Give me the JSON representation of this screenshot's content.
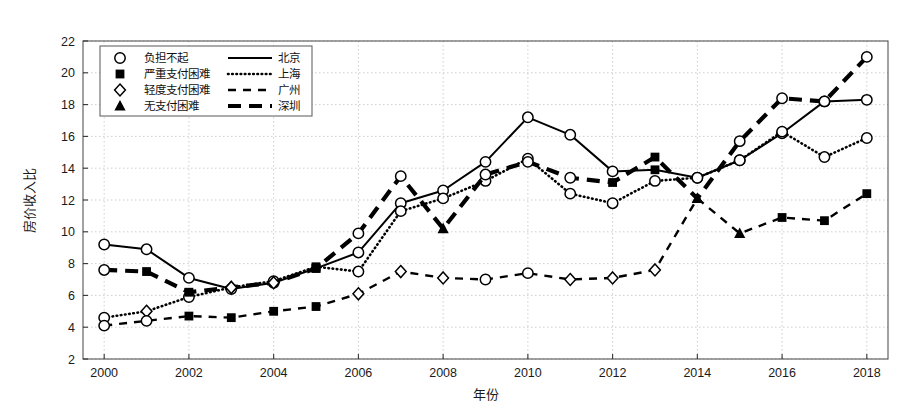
{
  "chart_data": {
    "type": "line",
    "title": "",
    "xlabel": "年份",
    "ylabel": "房价收入比",
    "xlim": [
      1999.5,
      2018.5
    ],
    "ylim": [
      2,
      22
    ],
    "ytick_step": 2,
    "xtick_step": 2,
    "grid": true,
    "grid_style": "dotted",
    "x": [
      2000,
      2001,
      2002,
      2003,
      2004,
      2005,
      2006,
      2007,
      2008,
      2009,
      2010,
      2011,
      2012,
      2013,
      2014,
      2015,
      2016,
      2017,
      2018
    ],
    "xticks": [
      "2000",
      "2002",
      "2004",
      "2006",
      "2008",
      "2010",
      "2012",
      "2014",
      "2016",
      "2018"
    ],
    "yticks": [
      "2",
      "4",
      "6",
      "8",
      "10",
      "12",
      "14",
      "16",
      "18",
      "20",
      "22"
    ],
    "legend_position": "upper-left",
    "series": [
      {
        "name": "北京",
        "line": "solid",
        "values": [
          9.2,
          8.9,
          7.1,
          6.4,
          6.8,
          7.7,
          8.7,
          11.8,
          12.6,
          14.4,
          17.2,
          16.1,
          13.8,
          13.9,
          13.4,
          14.5,
          16.2,
          18.2,
          18.3
        ],
        "status": [
          "负担不起",
          "负担不起",
          "负担不起",
          "负担不起",
          "负担不起",
          "严重支付困难",
          "负担不起",
          "负担不起",
          "负担不起",
          "负担不起",
          "负担不起",
          "负担不起",
          "负担不起",
          "严重支付困难",
          "负担不起",
          "负担不起",
          "负担不起",
          "负担不起",
          "负担不起"
        ]
      },
      {
        "name": "上海",
        "line": "dotted",
        "values": [
          4.6,
          5.0,
          5.9,
          6.5,
          6.9,
          7.8,
          7.5,
          11.3,
          12.1,
          13.2,
          14.6,
          12.4,
          11.8,
          13.2,
          13.4,
          14.5,
          16.3,
          14.7,
          15.9
        ],
        "status": [
          "负担不起",
          "轻度支付困难",
          "负担不起",
          "轻度支付困难",
          "负担不起",
          "严重支付困难",
          "负担不起",
          "负担不起",
          "负担不起",
          "负担不起",
          "负担不起",
          "负担不起",
          "负担不起",
          "负担不起",
          "负担不起",
          "负担不起",
          "负担不起",
          "负担不起",
          "负担不起"
        ]
      },
      {
        "name": "广州",
        "line": "dashed",
        "values": [
          4.1,
          4.4,
          4.7,
          4.6,
          5.0,
          5.3,
          6.1,
          7.5,
          7.1,
          7.0,
          7.4,
          7.0,
          7.1,
          7.6,
          12.1,
          9.9,
          10.9,
          10.7,
          12.4
        ],
        "status": [
          "负担不起",
          "负担不起",
          "严重支付困难",
          "严重支付困难",
          "严重支付困难",
          "严重支付困难",
          "轻度支付困难",
          "轻度支付困难",
          "轻度支付困难",
          "负担不起",
          "负担不起",
          "轻度支付困难",
          "轻度支付困难",
          "轻度支付困难",
          "无支付困难",
          "无支付困难",
          "严重支付困难",
          "严重支付困难",
          "严重支付困难"
        ]
      },
      {
        "name": "深圳",
        "line": "thick-dashed",
        "values": [
          7.6,
          7.5,
          6.2,
          6.5,
          6.8,
          7.7,
          9.9,
          13.5,
          10.2,
          13.6,
          14.4,
          13.4,
          13.1,
          14.7,
          12.1,
          15.7,
          18.4,
          18.2,
          21.0
        ],
        "status": [
          "负担不起",
          "严重支付困难",
          "严重支付困难",
          "轻度支付困难",
          "轻度支付困难",
          "严重支付困难",
          "负担不起",
          "负担不起",
          "无支付困难",
          "负担不起",
          "负担不起",
          "负担不起",
          "严重支付困难",
          "严重支付困难",
          "无支付困难",
          "负担不起",
          "负担不起",
          "负担不起",
          "负担不起"
        ]
      }
    ],
    "marker_legend": [
      {
        "marker": "circle-open",
        "label": "负担不起"
      },
      {
        "marker": "square-filled",
        "label": "严重支付困难"
      },
      {
        "marker": "diamond-open",
        "label": "轻度支付困难"
      },
      {
        "marker": "triangle-filled",
        "label": "无支付困难"
      }
    ]
  },
  "colors": {
    "ink": "#000000",
    "grid": "#c8c8c8",
    "frame": "#555555",
    "background": "#ffffff"
  }
}
